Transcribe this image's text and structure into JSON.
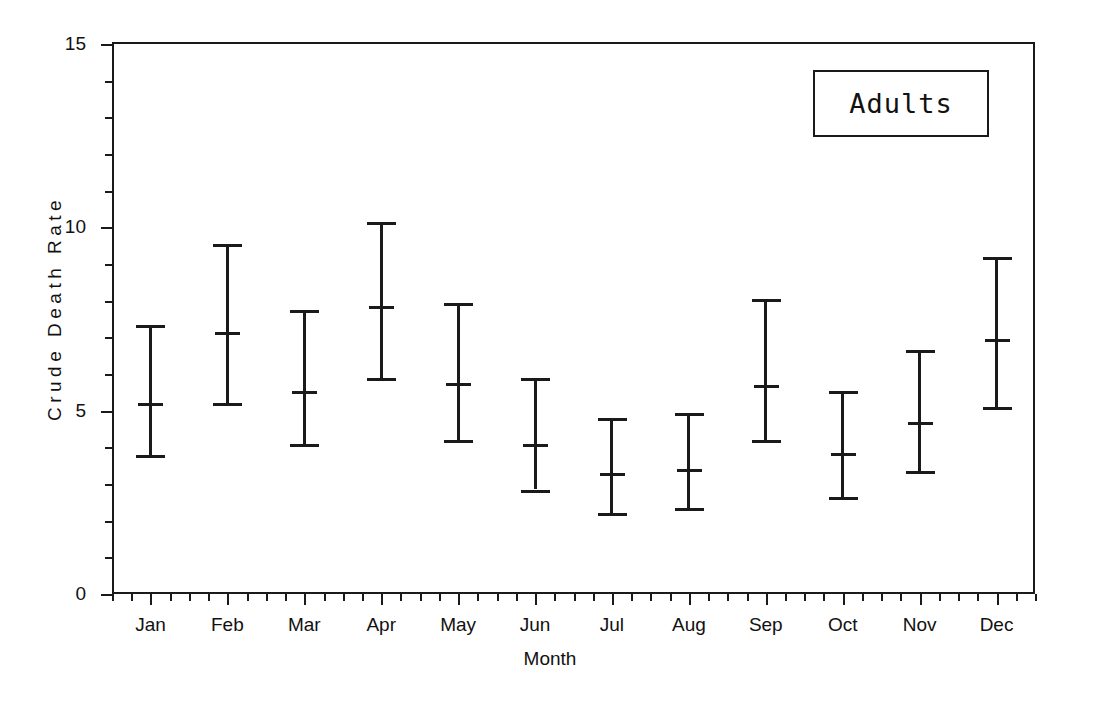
{
  "figure": {
    "legend_label": "Adults"
  },
  "chart_data": {
    "type": "scatter",
    "title": "Adults",
    "xlabel": "Month",
    "ylabel": "Crude Death Rate",
    "xlim": [
      0,
      12
    ],
    "ylim": [
      0,
      15.05
    ],
    "grid": false,
    "legend_position": "top-right",
    "y_ticks": [
      0,
      5,
      10,
      15
    ],
    "y_tick_labels": [
      "0",
      "5",
      "10",
      "15"
    ],
    "y_minor_tick_interval": 1,
    "x_minor_ticks_per_interval": 4,
    "categories": [
      "Jan",
      "Feb",
      "Mar",
      "Apr",
      "May",
      "Jun",
      "Jul",
      "Aug",
      "Sep",
      "Oct",
      "Nov",
      "Dec"
    ],
    "series": [
      {
        "name": "Crude Death Rate",
        "marker": "error-bar-with-mean-tick",
        "values": [
          5.2,
          7.15,
          5.55,
          7.85,
          5.75,
          4.1,
          3.3,
          3.4,
          5.7,
          3.85,
          4.7,
          6.95
        ],
        "lower": [
          3.8,
          5.2,
          4.1,
          5.9,
          4.2,
          2.85,
          2.2,
          2.35,
          4.2,
          2.65,
          3.35,
          5.1
        ],
        "upper": [
          7.35,
          9.55,
          7.75,
          10.15,
          7.95,
          5.9,
          4.8,
          4.95,
          8.05,
          5.55,
          6.65,
          9.2
        ]
      }
    ],
    "colors": {
      "line": "#1a1a1a",
      "background": "#ffffff"
    }
  }
}
